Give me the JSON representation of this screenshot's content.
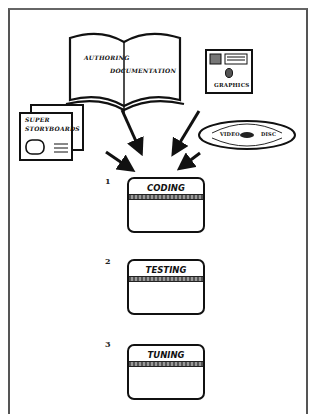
{
  "diagram": {
    "inputs": {
      "book": {
        "line1": "AUTHORING",
        "line2": "DOCUMENTATION"
      },
      "graphics": {
        "label": "GRAPHICS"
      },
      "storyboards": {
        "line1": "SUPER",
        "line2": "STORYBOARDS"
      },
      "videodisc": {
        "left": "VIDEO",
        "right": "DISC"
      }
    },
    "stages": [
      {
        "number": "1",
        "label": "CODING"
      },
      {
        "number": "2",
        "label": "TESTING"
      },
      {
        "number": "3",
        "label": "TUNING"
      }
    ],
    "colors": {
      "ink": "#111111",
      "paper": "#ffffff",
      "frame": "#555555"
    }
  }
}
